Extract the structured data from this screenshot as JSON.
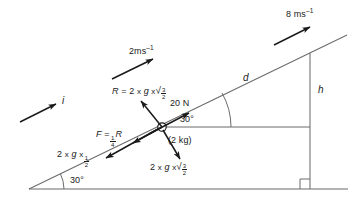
{
  "figure": {
    "kind": "physics-force-diagram-inclined-plane",
    "background_color": "#ffffff",
    "line_color": "#4d4d4d",
    "vector_color": "#1a1a1a",
    "text_color": "#1a1a1a"
  },
  "labels": {
    "velocity_top": {
      "value": "8",
      "unit_main": "ms",
      "unit_exp": "–1",
      "text": "8 ms⁻¹"
    },
    "velocity_mid": {
      "value": "2",
      "unit_main": "ms",
      "unit_exp": "–1",
      "text": "2ms⁻¹"
    },
    "unit_vector": {
      "text": "i"
    },
    "reaction": {
      "lead": "R",
      "equals": "=",
      "mass": "2",
      "times1": "x",
      "gravity": "g",
      "times2": "x",
      "radical": "√",
      "frac_num": "3",
      "frac_den": "2",
      "text": "R = 2 x g x √(3/2)"
    },
    "applied_force": {
      "text": "20 N"
    },
    "friction": {
      "lead": "F",
      "equals": "=",
      "frac_num": "1",
      "frac_den": "4",
      "trail": "R",
      "text": "F = ¼R"
    },
    "weight_parallel": {
      "mass": "2",
      "times1": "x",
      "gravity": "g",
      "times2": "x",
      "frac_num": "1",
      "frac_den": "2",
      "text": "2 x g x ½"
    },
    "weight_perp": {
      "mass": "2",
      "times1": "x",
      "gravity": "g",
      "times2": "x",
      "radical": "√",
      "frac_num": "3",
      "frac_den": "2",
      "text": "2 x g x √(3/2)"
    },
    "mass_label": {
      "text": "(2 kg)"
    },
    "distance": {
      "text": "d"
    },
    "height": {
      "text": "h"
    },
    "angle_block": {
      "text": "30°"
    },
    "angle_base": {
      "text": "30°"
    }
  },
  "geometry": {
    "incline_start": {
      "x": 29,
      "y": 189
    },
    "incline_end": {
      "x": 347,
      "y": 35
    },
    "base_start": {
      "x": 29,
      "y": 189
    },
    "base_end": {
      "x": 348,
      "y": 189
    },
    "vertical_top": {
      "x": 310,
      "y": 53
    },
    "vertical_bottom": {
      "x": 310,
      "y": 189
    },
    "block": {
      "x": 162,
      "y": 127,
      "r": 4
    },
    "incline_angle_deg": 30
  },
  "vectors": [
    {
      "name": "velocity-8",
      "x1": 274,
      "y1": 45,
      "x2": 312,
      "y2": 26
    },
    {
      "name": "velocity-2",
      "x1": 112,
      "y1": 79,
      "x2": 155,
      "y2": 58
    },
    {
      "name": "unit-vector-i",
      "x1": 20,
      "y1": 122,
      "x2": 58,
      "y2": 103
    },
    {
      "name": "reaction-R",
      "x1": 162,
      "y1": 127,
      "x2": 140,
      "y2": 100
    },
    {
      "name": "applied-20N",
      "x1": 148,
      "y1": 134,
      "x2": 191,
      "y2": 112
    },
    {
      "name": "friction-F",
      "x1": 162,
      "y1": 127,
      "x2": 131,
      "y2": 144
    },
    {
      "name": "weight-parallel",
      "x1": 162,
      "y1": 127,
      "x2": 104,
      "y2": 159
    },
    {
      "name": "weight-perp",
      "x1": 162,
      "y1": 127,
      "x2": 181,
      "y2": 160
    }
  ]
}
